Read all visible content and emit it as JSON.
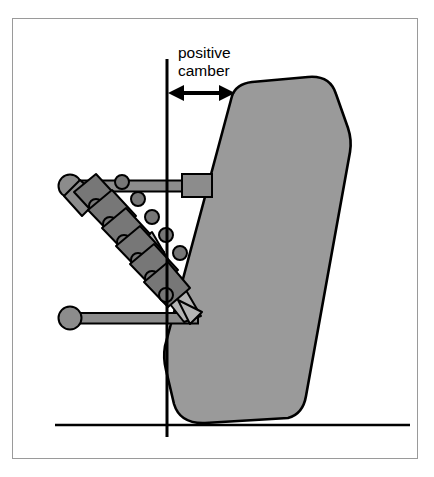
{
  "diagram": {
    "annotation": {
      "line1": "positive",
      "line2": "camber",
      "text_x": 178,
      "text_y1": 58,
      "text_y2": 76
    },
    "colors": {
      "tire_fill": "#9a9a9a",
      "arm_fill": "#8c8c8c",
      "spring_fill": "#777777",
      "rod_fill": "#b4b4b4",
      "outline": "#000000",
      "frame_border": "#9a9a9a",
      "background": "#ffffff"
    },
    "frame": {
      "x": 12,
      "y": 18,
      "width": 406,
      "height": 441
    },
    "ground_line": {
      "x1": 55,
      "y1": 425,
      "x2": 410,
      "y2": 425,
      "width": 2.5
    },
    "vertical_reference_line": {
      "x": 167,
      "y1": 59,
      "y2": 437,
      "width": 3
    },
    "camber_arrow": {
      "x1": 170,
      "x2": 233,
      "y": 93,
      "heads": "both",
      "label": "positive camber"
    },
    "tire": {
      "label": "wheel tire cross-section",
      "tilt": "outward at top",
      "corner_radius": 34
    },
    "upper_control_arm": {
      "ball_joint": {
        "cx": 70,
        "cy": 186,
        "r": 11
      },
      "bar": {
        "x1": 70,
        "y1": 186,
        "x2": 186,
        "y2": 186,
        "thickness": 11
      },
      "knuckle_block": {
        "x": 182,
        "y": 174,
        "w": 30,
        "h": 23
      }
    },
    "lower_control_arm": {
      "ball_joint": {
        "cx": 70,
        "cy": 318,
        "r": 11
      },
      "bar": {
        "x1": 70,
        "y1": 318,
        "x2": 196,
        "y2": 318,
        "thickness": 10
      }
    },
    "coil_spring": {
      "turns": 6,
      "start": {
        "x": 82,
        "y": 196
      },
      "end": {
        "x": 158,
        "y": 272
      }
    },
    "shock_rod": {
      "start": {
        "x": 150,
        "y": 262
      },
      "tip": {
        "x": 196,
        "y": 318
      }
    }
  }
}
